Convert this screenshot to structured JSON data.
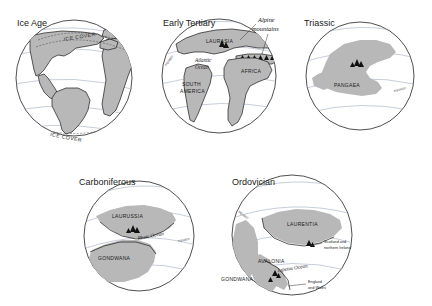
{
  "figure": {
    "background_color": "#ffffff",
    "land_fill_color": "#b8b8b8",
    "land_fill_soft_color": "#c3c3c3",
    "outline_color": "#1a1a1a",
    "gridline_color": "#8d9bb5"
  },
  "globes": [
    {
      "id": "ice-age",
      "title": "Ice Age",
      "landmasses": [],
      "oceans": [],
      "grid_labels": [],
      "ice_labels": [
        "ICE COVER",
        "ICE COVER"
      ],
      "annotations": []
    },
    {
      "id": "early-tertiary",
      "title": "Early Tertiary",
      "landmasses": [
        "LAURASIA",
        "AFRICA",
        "SOUTH AMERICA"
      ],
      "oceans": [
        "Atlantic Ocean"
      ],
      "grid_labels": [
        "equator"
      ],
      "ice_labels": [],
      "annotations": [
        "Alpine mountains"
      ]
    },
    {
      "id": "triassic",
      "title": "Triassic",
      "landmasses": [
        "PANGAEA"
      ],
      "oceans": [],
      "grid_labels": [
        "equator"
      ],
      "ice_labels": [],
      "annotations": []
    },
    {
      "id": "carboniferous",
      "title": "Carboniferous",
      "landmasses": [
        "LAURUSSIA",
        "GONDWANA"
      ],
      "oceans": [
        "Rheic Ocean"
      ],
      "grid_labels": [
        "equator"
      ],
      "ice_labels": [],
      "annotations": []
    },
    {
      "id": "ordovician",
      "title": "Ordovician",
      "landmasses": [
        "LAURENTIA",
        "AVALONIA",
        "GONDWANA"
      ],
      "oceans": [
        "Iapetus Ocean"
      ],
      "grid_labels": [
        "equator"
      ],
      "ice_labels": [],
      "annotations": [
        "Scotland and northern Ireland",
        "England and Wales"
      ]
    }
  ],
  "labels": {
    "ice_age_title": "Ice Age",
    "ice_cover_top": "ICE COVER",
    "ice_cover_bottom": "ICE COVER",
    "early_tertiary_title": "Early Tertiary",
    "laurasia": "LAURASIA",
    "alpine_mountains_line1": "Alpine",
    "alpine_mountains_line2": "mountains",
    "atlantic_line1": "Atlantic",
    "atlantic_line2": "Ocean",
    "africa": "AFRICA",
    "south_america_line1": "SOUTH",
    "south_america_line2": "AMERICA",
    "equator_et": "equator",
    "triassic_title": "Triassic",
    "pangaea": "PANGAEA",
    "equator_tr": "equator",
    "carboniferous_title": "Carboniferous",
    "laurussia": "LAURUSSIA",
    "gondwana_carb": "GONDWANA",
    "rheic_ocean": "Rheic Ocean",
    "equator_carb": "equator",
    "ordovician_title": "Ordovician",
    "laurentia": "LAURENTIA",
    "avalonia": "AVALONIA",
    "gondwana_ord": "GONDWANA",
    "iapetus_ocean": "Iapetus Ocean",
    "equator_ord": "equator",
    "scotland_line1": "Scotland and",
    "scotland_line2": "northern Ireland",
    "england_line1": "England",
    "england_line2": "and Wales"
  }
}
